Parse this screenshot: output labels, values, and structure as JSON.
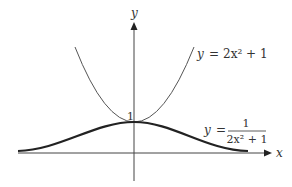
{
  "figure": {
    "axes": {
      "x_label": "x",
      "y_label": "y"
    },
    "intercept_label": "1",
    "curves": [
      {
        "name": "parabola",
        "equation": "y = 2x² + 1",
        "lhs": "y",
        "eq": "=",
        "rhs": "2x² + 1",
        "stroke": "thin"
      },
      {
        "name": "bell",
        "equation": "y = 1/(2x² + 1)",
        "lhs": "y",
        "eq": "=",
        "numerator": "1",
        "denominator": "2x² + 1",
        "stroke": "thick"
      }
    ],
    "colors": {
      "axis": "#333333",
      "curve": "#222222",
      "background": "#ffffff"
    }
  }
}
